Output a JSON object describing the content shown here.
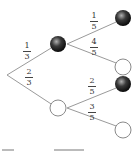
{
  "diagram": {
    "type": "probability-tree",
    "root": {
      "x": 7,
      "y": 75
    },
    "level1": [
      {
        "id": "b1",
        "color": "black",
        "x": 58,
        "y": 44,
        "prob": {
          "num": "1",
          "den": "3"
        },
        "label_pos": {
          "x": 22,
          "y": 42
        }
      },
      {
        "id": "w1",
        "color": "white",
        "x": 58,
        "y": 108,
        "prob": {
          "num": "2",
          "den": "3"
        },
        "label_pos": {
          "x": 24,
          "y": 68
        }
      }
    ],
    "level2": [
      {
        "parent": "b1",
        "color": "black",
        "x": 123,
        "y": 18,
        "prob": {
          "num": "1",
          "den": "5"
        },
        "label_pos": {
          "x": 89,
          "y": 12
        }
      },
      {
        "parent": "b1",
        "color": "white",
        "x": 123,
        "y": 67,
        "prob": {
          "num": "4",
          "den": "5"
        },
        "label_pos": {
          "x": 89,
          "y": 38
        }
      },
      {
        "parent": "w1",
        "color": "black",
        "x": 123,
        "y": 84,
        "prob": {
          "num": "2",
          "den": "5"
        },
        "label_pos": {
          "x": 87,
          "y": 77
        }
      },
      {
        "parent": "w1",
        "color": "white",
        "x": 123,
        "y": 130,
        "prob": {
          "num": "3",
          "den": "5"
        },
        "label_pos": {
          "x": 87,
          "y": 103
        }
      }
    ],
    "colors": {
      "line": "#9a9a9a",
      "ball_dark": "#1a1a1a",
      "ball_highlight": "#9a9a9a",
      "circle_stroke": "#8a8a8a",
      "text": "#333333"
    }
  }
}
